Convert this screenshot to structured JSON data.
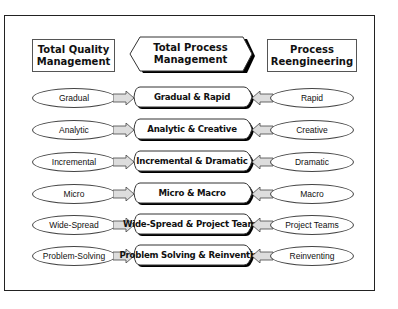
{
  "diagram": {
    "headers": {
      "left": {
        "line1": "Total Quality",
        "line2": "Management"
      },
      "center": {
        "line1": "Total Process",
        "line2": "Management"
      },
      "right": {
        "line1": "Process",
        "line2": "Reengineering"
      }
    },
    "rows": [
      {
        "left": "Gradual",
        "center": "Gradual & Rapid",
        "right": "Rapid"
      },
      {
        "left": "Analytic",
        "center": "Analytic & Creative",
        "right": "Creative"
      },
      {
        "left": "Incremental",
        "center": "Incremental & Dramatic",
        "right": "Dramatic"
      },
      {
        "left": "Micro",
        "center": "Micro & Macro",
        "right": "Macro"
      },
      {
        "left": "Wide-Spread",
        "center": "Wide-Spread & Project Teams",
        "right": "Project Teams"
      },
      {
        "left": "Problem-Solving",
        "center": "Problem Solving & Reinventing",
        "right": "Reinventing"
      }
    ],
    "colors": {
      "outline": "#222222",
      "arrow_fill": "#dddddd",
      "shadow": "#000000"
    }
  }
}
